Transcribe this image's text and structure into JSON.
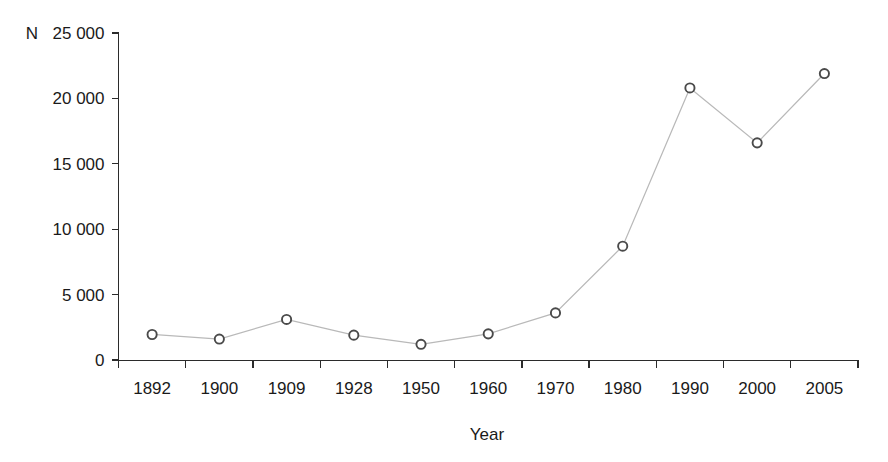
{
  "chart_data": {
    "type": "line",
    "title": "",
    "subtitle": "",
    "xlabel": "Year",
    "ylabel": "N",
    "y_unit_prefix": "N",
    "categories": [
      "1892",
      "1900",
      "1909",
      "1928",
      "1950",
      "1960",
      "1970",
      "1980",
      "1990",
      "2000",
      "2005"
    ],
    "values": [
      1950,
      1600,
      3100,
      1900,
      1200,
      2000,
      3600,
      8700,
      20800,
      16600,
      21900
    ],
    "series": [
      {
        "name": "N",
        "values": [
          1950,
          1600,
          3100,
          1900,
          1200,
          2000,
          3600,
          8700,
          20800,
          16600,
          21900
        ]
      }
    ],
    "ylim": [
      0,
      25000
    ],
    "yticks": [
      0,
      5000,
      10000,
      15000,
      20000,
      25000
    ],
    "ytick_labels": [
      "0",
      "5 000",
      "10 000",
      "15 000",
      "20 000",
      "25 000"
    ],
    "xtick_labels": [
      "1892",
      "1900",
      "1909",
      "1928",
      "1950",
      "1960",
      "1970",
      "1980",
      "1990",
      "2000",
      "2005"
    ],
    "grid": false,
    "legend": false,
    "legend_position": "none",
    "marker": "open-circle",
    "colors": {
      "line": "#b9b9b9",
      "marker_stroke": "#4a4a4a",
      "marker_fill": "#ffffff",
      "axis": "#2b2b2b",
      "text": "#1a1a1a",
      "background": "#ffffff"
    }
  }
}
